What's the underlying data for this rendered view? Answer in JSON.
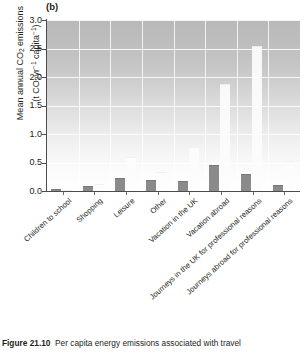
{
  "figure": {
    "panel_label": "(b)",
    "caption_prefix": "Figure 21.10",
    "caption_text": "Per capita energy emissions associated with travel"
  },
  "chart_data": {
    "type": "bar",
    "title": "",
    "subtitle": "(b)",
    "xlabel": "",
    "ylabel": "Mean annual CO2 emissions (t CO2 yr-1 capita-1)",
    "ylabel_line1": "Mean annual CO2 emissions",
    "ylabel_line2": "(t CO2 yr-1 capita-1)",
    "ylim": [
      0.0,
      3.0
    ],
    "yticks": [
      "0.0",
      "0.5",
      "1.0",
      "1.5",
      "2.0",
      "2.5",
      "3.0"
    ],
    "ytick_values": [
      0.0,
      0.5,
      1.0,
      1.5,
      2.0,
      2.5,
      3.0
    ],
    "grid": true,
    "legend": "none",
    "categories": [
      "Children to school",
      "Shopping",
      "Leisure",
      "Other",
      "Vacation in the UK",
      "Vacation abroad",
      "Journeys in the UK for professional reasons",
      "Journeys abroad for professional reasons"
    ],
    "series": [
      {
        "name": "dark-bar",
        "color": "#8a8a8a",
        "values": [
          0.03,
          0.08,
          0.22,
          0.2,
          0.17,
          0.45,
          0.3,
          0.1
        ]
      },
      {
        "name": "light-bar",
        "color": "#fdfdfd",
        "values": [
          0.02,
          0.13,
          0.6,
          0.33,
          0.77,
          1.88,
          2.55,
          0.52
        ]
      }
    ]
  }
}
